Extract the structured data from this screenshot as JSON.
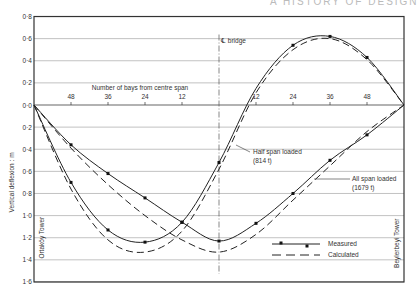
{
  "header": {
    "text": "A HISTORY OF DESIGN"
  },
  "chart_data": {
    "type": "line",
    "title": "",
    "xlabel": "Number of bays from centre span",
    "ylabel": "Vertical deflexion : m",
    "x_ticks": [
      "48",
      "36",
      "24",
      "12",
      "12",
      "24",
      "36",
      "48"
    ],
    "x_tick_positions": [
      -48,
      -36,
      -24,
      -12,
      12,
      24,
      36,
      48
    ],
    "x_range": [
      -60,
      60
    ],
    "y_tick_labels": [
      "0·8",
      "0·6",
      "0·4",
      "0·2",
      "0·0",
      "0·2",
      "0·4",
      "0·6",
      "0·8",
      "1·0",
      "1·2",
      "1·4",
      "1·6"
    ],
    "y_tick_values": [
      0.8,
      0.6,
      0.4,
      0.2,
      0.0,
      -0.2,
      -0.4,
      -0.6,
      -0.8,
      -1.0,
      -1.2,
      -1.4,
      -1.6
    ],
    "ylim": [
      -1.6,
      0.8
    ],
    "grid": true,
    "annotations": {
      "centreline": "℄ bridge",
      "left_tower": "Ortaköy Tower",
      "right_tower": "Beylerbeyi Tower",
      "half_span": [
        "Half span loaded",
        "(814 t)"
      ],
      "all_span": [
        "All span loaded",
        "(1679 t)"
      ]
    },
    "legend": {
      "position": "lower right",
      "entries": [
        {
          "label": "Measured",
          "style": "solid-with-markers"
        },
        {
          "label": "Calculated",
          "style": "dashed"
        }
      ]
    },
    "series": [
      {
        "name": "Half span loaded (814 t) - Measured",
        "style": "solid",
        "x": [
          -60,
          -48,
          -36,
          -24,
          -12,
          0,
          12,
          24,
          36,
          48,
          60
        ],
        "y": [
          0.0,
          -0.7,
          -1.13,
          -1.24,
          -1.06,
          -0.52,
          0.15,
          0.54,
          0.62,
          0.43,
          0.0
        ],
        "markers_x": [
          -48,
          -36,
          -24,
          -12,
          0,
          24,
          36,
          48
        ]
      },
      {
        "name": "Half span loaded (814 t) - Calculated",
        "style": "dashed",
        "x": [
          -60,
          -48,
          -36,
          -24,
          -12,
          0,
          12,
          24,
          36,
          48,
          60
        ],
        "y": [
          0.0,
          -0.76,
          -1.22,
          -1.33,
          -1.14,
          -0.58,
          0.11,
          0.5,
          0.6,
          0.41,
          0.0
        ]
      },
      {
        "name": "All span loaded (1679 t) - Measured",
        "style": "solid",
        "x": [
          -60,
          -48,
          -36,
          -24,
          -12,
          0,
          12,
          24,
          36,
          48,
          60
        ],
        "y": [
          0.0,
          -0.36,
          -0.62,
          -0.84,
          -1.06,
          -1.23,
          -1.07,
          -0.8,
          -0.5,
          -0.27,
          0.0
        ],
        "markers_x": [
          -48,
          -36,
          -24,
          -12,
          0,
          12,
          24,
          36,
          48
        ]
      },
      {
        "name": "All span loaded (1679 t) - Calculated",
        "style": "dashed",
        "x": [
          -60,
          -48,
          -36,
          -24,
          -12,
          0,
          12,
          24,
          36,
          48,
          60
        ],
        "y": [
          0.0,
          -0.39,
          -0.72,
          -1.0,
          -1.22,
          -1.33,
          -1.17,
          -0.86,
          -0.55,
          -0.24,
          0.0
        ]
      }
    ]
  }
}
